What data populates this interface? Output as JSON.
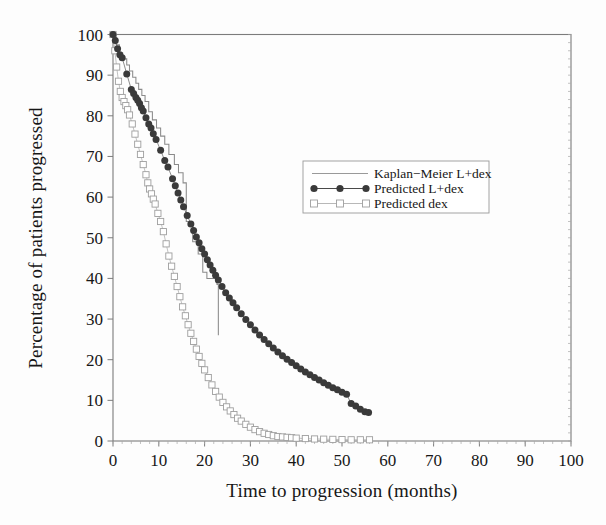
{
  "chart_data": {
    "type": "line",
    "title": "",
    "xlabel": "Time to progression (months)",
    "ylabel": "Percentage of patients progressed",
    "xlim": [
      0,
      100
    ],
    "ylim": [
      0,
      100
    ],
    "xticks": [
      0,
      10,
      20,
      30,
      40,
      50,
      60,
      70,
      80,
      90,
      100
    ],
    "yticks": [
      0,
      10,
      20,
      30,
      40,
      50,
      60,
      70,
      80,
      90,
      100
    ],
    "xtick_labels": [
      "0",
      "10",
      "20",
      "30",
      "40",
      "50",
      "60",
      "70",
      "80",
      "90",
      "100"
    ],
    "ytick_labels": [
      "0",
      "10",
      "20",
      "30",
      "40",
      "50",
      "60",
      "70",
      "80",
      "90",
      "100"
    ],
    "grid": false,
    "legend_position": "center-right-upper",
    "series": [
      {
        "name": "Kaplan-Meier L+dex",
        "style": "step",
        "marker": "none",
        "color": "#8a8a8a",
        "points": [
          [
            0,
            100
          ],
          [
            0.7,
            100
          ],
          [
            0.7,
            97.5
          ],
          [
            1.4,
            97.5
          ],
          [
            1.4,
            95.5
          ],
          [
            2.1,
            95.5
          ],
          [
            2.1,
            94.0
          ],
          [
            3.0,
            94.0
          ],
          [
            3.0,
            92.5
          ],
          [
            3.6,
            92.5
          ],
          [
            3.6,
            91.0
          ],
          [
            4.3,
            91.0
          ],
          [
            4.3,
            89.5
          ],
          [
            5.0,
            89.5
          ],
          [
            5.0,
            88.0
          ],
          [
            5.6,
            88.0
          ],
          [
            5.6,
            86.5
          ],
          [
            6.3,
            86.5
          ],
          [
            6.3,
            85.0
          ],
          [
            7.0,
            85.0
          ],
          [
            7.0,
            83.5
          ],
          [
            7.8,
            83.5
          ],
          [
            7.8,
            81.0
          ],
          [
            8.6,
            81.0
          ],
          [
            8.6,
            79.0
          ],
          [
            9.5,
            79.0
          ],
          [
            9.5,
            77.0
          ],
          [
            10.4,
            77.0
          ],
          [
            10.4,
            75.0
          ],
          [
            11.3,
            75.0
          ],
          [
            11.3,
            73.0
          ],
          [
            12.2,
            73.0
          ],
          [
            12.2,
            70.5
          ],
          [
            13.4,
            70.5
          ],
          [
            13.4,
            68.0
          ],
          [
            14.3,
            68.0
          ],
          [
            14.3,
            66.0
          ],
          [
            15.3,
            66.0
          ],
          [
            15.3,
            63.5
          ],
          [
            16.0,
            63.5
          ],
          [
            16.0,
            54.0
          ],
          [
            17.4,
            54.0
          ],
          [
            17.4,
            49.0
          ],
          [
            18.6,
            49.0
          ],
          [
            18.6,
            46.0
          ],
          [
            19.6,
            46.0
          ],
          [
            19.6,
            41.5
          ],
          [
            20.5,
            41.5
          ],
          [
            20.5,
            40.0
          ],
          [
            22.7,
            40.0
          ],
          [
            22.7,
            38.5
          ],
          [
            23.0,
            38.5
          ],
          [
            23.0,
            26.0
          ]
        ]
      },
      {
        "name": "Predicted L+dex",
        "style": "line-marker",
        "marker": "filled-circle",
        "color": "#3a3a3a",
        "points": [
          [
            0,
            100
          ],
          [
            0.5,
            98.5
          ],
          [
            1.0,
            96.5
          ],
          [
            1.5,
            95.0
          ],
          [
            2.0,
            94.3
          ],
          [
            3.0,
            90.3
          ],
          [
            4.0,
            86.5
          ],
          [
            4.5,
            85.5
          ],
          [
            5.0,
            84.5
          ],
          [
            5.4,
            83.8
          ],
          [
            5.8,
            83.0
          ],
          [
            6.2,
            82.0
          ],
          [
            6.6,
            81.2
          ],
          [
            7.2,
            79.5
          ],
          [
            7.8,
            78.0
          ],
          [
            8.3,
            77.0
          ],
          [
            8.8,
            75.6
          ],
          [
            9.4,
            74.2
          ],
          [
            10.4,
            71.5
          ],
          [
            11.3,
            69.0
          ],
          [
            12.0,
            67.4
          ],
          [
            13.0,
            64.5
          ],
          [
            13.6,
            62.8
          ],
          [
            14.2,
            61.0
          ],
          [
            14.8,
            59.3
          ],
          [
            15.4,
            57.6
          ],
          [
            16.2,
            55.5
          ],
          [
            17.0,
            53.4
          ],
          [
            17.6,
            51.8
          ],
          [
            18.2,
            50.2
          ],
          [
            18.8,
            48.8
          ],
          [
            19.4,
            47.3
          ],
          [
            20.0,
            46.0
          ],
          [
            20.6,
            44.6
          ],
          [
            21.2,
            43.3
          ],
          [
            21.8,
            42.0
          ],
          [
            22.4,
            40.8
          ],
          [
            23.0,
            39.6
          ],
          [
            23.8,
            38.0
          ],
          [
            24.6,
            36.5
          ],
          [
            25.4,
            35.2
          ],
          [
            26.2,
            34.0
          ],
          [
            27.0,
            32.8
          ],
          [
            28.0,
            31.3
          ],
          [
            29.0,
            29.9
          ],
          [
            30.0,
            28.6
          ],
          [
            31.0,
            27.3
          ],
          [
            32.0,
            26.1
          ],
          [
            33.0,
            25.0
          ],
          [
            34.0,
            23.9
          ],
          [
            35.0,
            22.9
          ],
          [
            36.0,
            21.9
          ],
          [
            37.0,
            21.0
          ],
          [
            38.0,
            20.1
          ],
          [
            39.0,
            19.3
          ],
          [
            40.0,
            18.5
          ],
          [
            41.0,
            17.7
          ],
          [
            42.0,
            17.0
          ],
          [
            43.0,
            16.3
          ],
          [
            44.0,
            15.6
          ],
          [
            45.0,
            15.0
          ],
          [
            46.0,
            14.3
          ],
          [
            47.0,
            13.7
          ],
          [
            48.0,
            13.1
          ],
          [
            49.0,
            12.6
          ],
          [
            50.0,
            12.0
          ],
          [
            51.0,
            11.5
          ],
          [
            52.0,
            9.2
          ],
          [
            53.0,
            8.6
          ],
          [
            54.0,
            7.8
          ],
          [
            55.0,
            7.2
          ],
          [
            55.8,
            7.0
          ]
        ]
      },
      {
        "name": "Predicted dex",
        "style": "line-marker",
        "marker": "open-square",
        "color": "#b0b0b0",
        "points": [
          [
            0,
            100
          ],
          [
            0.4,
            96.0
          ],
          [
            0.8,
            92.0
          ],
          [
            1.2,
            88.5
          ],
          [
            1.6,
            86.0
          ],
          [
            2.0,
            84.5
          ],
          [
            2.4,
            83.5
          ],
          [
            2.8,
            82.5
          ],
          [
            3.2,
            81.5
          ],
          [
            3.6,
            80.2
          ],
          [
            4.2,
            78.0
          ],
          [
            4.8,
            75.5
          ],
          [
            5.4,
            73.0
          ],
          [
            6.0,
            70.5
          ],
          [
            6.6,
            68.0
          ],
          [
            7.2,
            65.5
          ],
          [
            7.6,
            63.5
          ],
          [
            8.0,
            62.0
          ],
          [
            8.4,
            60.8
          ],
          [
            8.8,
            59.5
          ],
          [
            9.2,
            58.3
          ],
          [
            9.8,
            56.0
          ],
          [
            10.4,
            54.0
          ],
          [
            11.0,
            51.5
          ],
          [
            11.6,
            48.5
          ],
          [
            12.2,
            45.5
          ],
          [
            12.8,
            43.0
          ],
          [
            13.4,
            40.5
          ],
          [
            14.0,
            38.0
          ],
          [
            14.6,
            35.5
          ],
          [
            15.2,
            33.0
          ],
          [
            15.8,
            30.8
          ],
          [
            16.4,
            28.6
          ],
          [
            17.0,
            26.5
          ],
          [
            17.6,
            24.5
          ],
          [
            18.2,
            22.6
          ],
          [
            18.8,
            20.8
          ],
          [
            19.4,
            19.1
          ],
          [
            20.0,
            17.5
          ],
          [
            20.8,
            15.6
          ],
          [
            21.6,
            13.8
          ],
          [
            22.4,
            12.2
          ],
          [
            23.2,
            10.8
          ],
          [
            24.0,
            9.5
          ],
          [
            24.8,
            8.4
          ],
          [
            25.6,
            7.4
          ],
          [
            26.4,
            6.5
          ],
          [
            27.2,
            5.6
          ],
          [
            28.0,
            4.9
          ],
          [
            29.0,
            4.1
          ],
          [
            30.0,
            3.4
          ],
          [
            31.0,
            2.8
          ],
          [
            32.0,
            2.3
          ],
          [
            33.0,
            1.9
          ],
          [
            34.0,
            1.6
          ],
          [
            35.0,
            1.3
          ],
          [
            36.0,
            1.1
          ],
          [
            37.0,
            1.0
          ],
          [
            38.0,
            0.9
          ],
          [
            39.0,
            0.8
          ],
          [
            40.0,
            0.7
          ],
          [
            42.0,
            0.6
          ],
          [
            44.0,
            0.5
          ],
          [
            46.0,
            0.45
          ],
          [
            48.0,
            0.4
          ],
          [
            50.0,
            0.35
          ],
          [
            52.0,
            0.3
          ],
          [
            54.0,
            0.3
          ],
          [
            56.0,
            0.3
          ]
        ]
      }
    ]
  },
  "legend": {
    "entries": [
      {
        "label": "Kaplan−Meier L+dex",
        "marker": "plain-line"
      },
      {
        "label": "Predicted L+dex",
        "marker": "filled-circle-line"
      },
      {
        "label": "Predicted dex",
        "marker": "open-square-line"
      }
    ]
  }
}
